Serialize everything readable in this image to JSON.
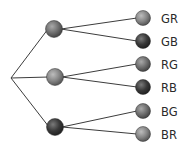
{
  "diagram": {
    "type": "tree-diagram",
    "root": {
      "x": 11,
      "y": 78
    },
    "colors": {
      "G": "#707070",
      "R": "#8a8a8a",
      "B": "#3a3a3a",
      "line": "#3c3c3c",
      "text": "#2a2a2a"
    },
    "level1": [
      {
        "id": "G",
        "x": 54,
        "y": 29
      },
      {
        "id": "R",
        "x": 55,
        "y": 77
      },
      {
        "id": "B",
        "x": 55,
        "y": 127
      }
    ],
    "leaves": [
      {
        "parent": 0,
        "ball": "R",
        "label": "GR",
        "x": 143,
        "y": 18
      },
      {
        "parent": 0,
        "ball": "B",
        "label": "GB",
        "x": 143,
        "y": 41
      },
      {
        "parent": 1,
        "ball": "G",
        "label": "RG",
        "x": 143,
        "y": 64
      },
      {
        "parent": 1,
        "ball": "B",
        "label": "RB",
        "x": 143,
        "y": 87
      },
      {
        "parent": 2,
        "ball": "G",
        "label": "BG",
        "x": 143,
        "y": 111
      },
      {
        "parent": 2,
        "ball": "R",
        "label": "BR",
        "x": 143,
        "y": 134
      }
    ]
  },
  "labels": [
    "GR",
    "GB",
    "RG",
    "RB",
    "BG",
    "BR"
  ]
}
